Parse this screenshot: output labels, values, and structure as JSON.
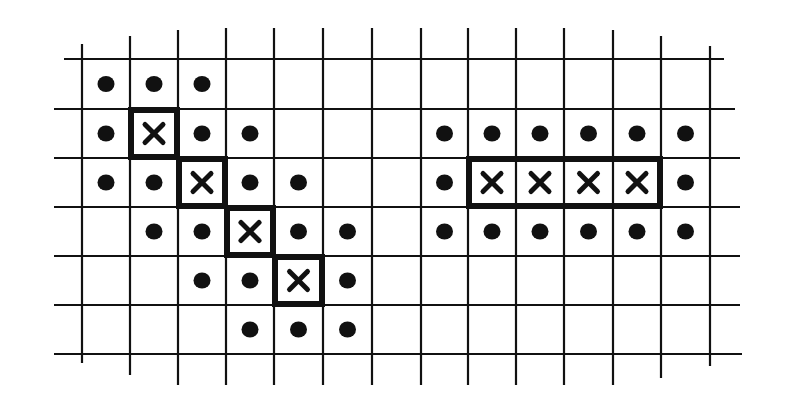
{
  "diagram": {
    "grid": {
      "columns": 13,
      "rows": 6
    },
    "colors": {
      "ink": "#111111",
      "background": "#ffffff"
    },
    "figures": [
      {
        "name": "diagonal-pattern",
        "crosses": [
          [
            1,
            1
          ],
          [
            2,
            2
          ],
          [
            3,
            3
          ],
          [
            4,
            4
          ]
        ],
        "dots": [
          [
            0,
            0
          ],
          [
            1,
            0
          ],
          [
            2,
            0
          ],
          [
            0,
            1
          ],
          [
            2,
            1
          ],
          [
            3,
            1
          ],
          [
            0,
            2
          ],
          [
            1,
            2
          ],
          [
            3,
            2
          ],
          [
            4,
            2
          ],
          [
            1,
            3
          ],
          [
            2,
            3
          ],
          [
            4,
            3
          ],
          [
            5,
            3
          ],
          [
            2,
            4
          ],
          [
            3,
            4
          ],
          [
            5,
            4
          ],
          [
            3,
            5
          ],
          [
            4,
            5
          ],
          [
            5,
            5
          ]
        ],
        "outline": "staircase"
      },
      {
        "name": "horizontal-pattern",
        "crosses": [
          [
            8,
            2
          ],
          [
            9,
            2
          ],
          [
            10,
            2
          ],
          [
            11,
            2
          ]
        ],
        "dots": [
          [
            7,
            1
          ],
          [
            8,
            1
          ],
          [
            9,
            1
          ],
          [
            10,
            1
          ],
          [
            11,
            1
          ],
          [
            12,
            1
          ],
          [
            7,
            2
          ],
          [
            12,
            2
          ],
          [
            7,
            3
          ],
          [
            8,
            3
          ],
          [
            9,
            3
          ],
          [
            10,
            3
          ],
          [
            11,
            3
          ],
          [
            12,
            3
          ]
        ],
        "outline": "rectangle"
      }
    ]
  }
}
